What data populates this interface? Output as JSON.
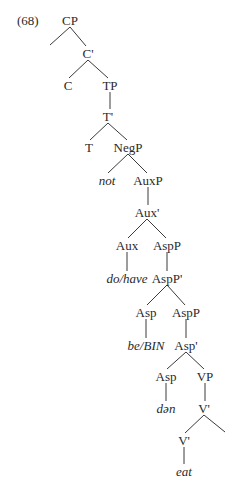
{
  "example_number": "(68)",
  "colors": {
    "text": "#2a2a2a",
    "line": "#3a3a3a",
    "background": "#ffffff"
  },
  "nodes": [
    {
      "id": "CP",
      "label": "CP",
      "x": 70,
      "y": 20,
      "italic": false
    },
    {
      "id": "C_bar",
      "label": "C'",
      "x": 88,
      "y": 53,
      "italic": false
    },
    {
      "id": "C",
      "label": "C",
      "x": 68,
      "y": 85,
      "italic": false
    },
    {
      "id": "TP",
      "label": "TP",
      "x": 110,
      "y": 85,
      "italic": false
    },
    {
      "id": "T_bar",
      "label": "T'",
      "x": 108,
      "y": 116,
      "italic": false
    },
    {
      "id": "T",
      "label": "T",
      "x": 89,
      "y": 147,
      "italic": false
    },
    {
      "id": "NegP",
      "label": "NegP",
      "x": 128,
      "y": 147,
      "italic": false
    },
    {
      "id": "not",
      "label": "not",
      "x": 107,
      "y": 180,
      "italic": true
    },
    {
      "id": "AuxP",
      "label": "AuxP",
      "x": 148,
      "y": 180,
      "italic": false
    },
    {
      "id": "Aux_bar",
      "label": "Aux'",
      "x": 147,
      "y": 212,
      "italic": false
    },
    {
      "id": "Aux",
      "label": "Aux",
      "x": 127,
      "y": 245,
      "italic": false
    },
    {
      "id": "AspP1",
      "label": "AspP",
      "x": 167,
      "y": 245,
      "italic": false
    },
    {
      "id": "do_have",
      "label": "do/have",
      "x": 127,
      "y": 278,
      "italic": true
    },
    {
      "id": "AspP_bar",
      "label": "AspP'",
      "x": 167,
      "y": 278,
      "italic": false
    },
    {
      "id": "Asp1",
      "label": "Asp",
      "x": 146,
      "y": 312,
      "italic": false
    },
    {
      "id": "AspP2",
      "label": "AspP",
      "x": 186,
      "y": 312,
      "italic": false
    },
    {
      "id": "be_BIN",
      "label": "be/BIN",
      "x": 146,
      "y": 345,
      "italic": true
    },
    {
      "id": "Asp_bar",
      "label": "Asp'",
      "x": 186,
      "y": 345,
      "italic": false
    },
    {
      "id": "Asp2",
      "label": "Asp",
      "x": 166,
      "y": 376,
      "italic": false
    },
    {
      "id": "VP",
      "label": "VP",
      "x": 205,
      "y": 376,
      "italic": false
    },
    {
      "id": "dan",
      "label": "dən",
      "x": 166,
      "y": 408,
      "italic": true
    },
    {
      "id": "V_bar1",
      "label": "V'",
      "x": 204,
      "y": 408,
      "italic": false
    },
    {
      "id": "V_bar2",
      "label": "V'",
      "x": 184,
      "y": 440,
      "italic": false
    },
    {
      "id": "eat",
      "label": "eat",
      "x": 184,
      "y": 471,
      "italic": true
    }
  ],
  "edges": [
    [
      70,
      27,
      50,
      45
    ],
    [
      70,
      27,
      86,
      46
    ],
    [
      88,
      60,
      69,
      78
    ],
    [
      88,
      60,
      108,
      78
    ],
    [
      110,
      92,
      110,
      109
    ],
    [
      108,
      123,
      90,
      140
    ],
    [
      108,
      123,
      127,
      140
    ],
    [
      128,
      154,
      108,
      173
    ],
    [
      128,
      154,
      147,
      173
    ],
    [
      148,
      187,
      148,
      205
    ],
    [
      147,
      219,
      128,
      238
    ],
    [
      147,
      219,
      166,
      238
    ],
    [
      127,
      252,
      127,
      271
    ],
    [
      167,
      252,
      167,
      271
    ],
    [
      167,
      285,
      147,
      305
    ],
    [
      167,
      285,
      185,
      305
    ],
    [
      146,
      319,
      146,
      338
    ],
    [
      186,
      319,
      186,
      338
    ],
    [
      186,
      352,
      167,
      369
    ],
    [
      186,
      352,
      204,
      369
    ],
    [
      166,
      383,
      166,
      401
    ],
    [
      205,
      383,
      205,
      401
    ],
    [
      204,
      415,
      185,
      433
    ],
    [
      204,
      415,
      225,
      432
    ],
    [
      184,
      447,
      184,
      464
    ]
  ]
}
